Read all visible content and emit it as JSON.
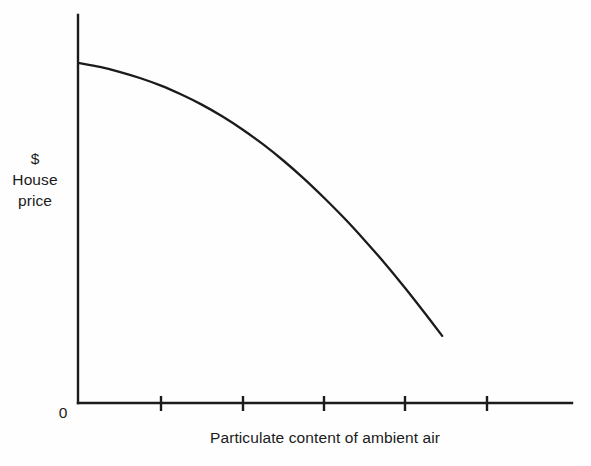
{
  "chart_data": {
    "type": "line",
    "title": "",
    "subtitle": "",
    "xlabel": "Particulate content of ambient air",
    "ylabel_lines": [
      "$",
      "House",
      "price"
    ],
    "ylabel": "$ House price",
    "origin_label": "0",
    "grid": false,
    "legend": null,
    "legend_position": "none",
    "axis_color": "#1b1b1b",
    "curve_color": "#1b1b1b",
    "background_color": "#fefefe",
    "xlim": [
      0,
      6.1
    ],
    "ylim": [
      0,
      1.0
    ],
    "x_tick_labels": [
      "",
      "",
      "",
      "",
      ""
    ],
    "x_tick_positions": [
      1,
      2,
      3,
      4,
      5
    ],
    "y_tick_labels": [],
    "annotations": [],
    "series": [
      {
        "name": "House price vs particulate content",
        "x": [
          0.0,
          0.25,
          0.5,
          0.75,
          1.0,
          1.25,
          1.5,
          1.75,
          2.0,
          2.25,
          2.5,
          2.75,
          3.0,
          3.25,
          3.5,
          3.75,
          4.0,
          4.25,
          4.45
        ],
        "y": [
          0.876,
          0.866,
          0.853,
          0.837,
          0.818,
          0.795,
          0.769,
          0.739,
          0.705,
          0.667,
          0.625,
          0.579,
          0.529,
          0.476,
          0.419,
          0.359,
          0.295,
          0.228,
          0.173
        ]
      }
    ],
    "points_pixels": [
      [
        78,
        62
      ],
      [
        161,
        100
      ],
      [
        243,
        165
      ],
      [
        324,
        250
      ],
      [
        405,
        330
      ],
      [
        441,
        372
      ]
    ],
    "shape_description": "Monotonically decreasing, concave-down curve"
  },
  "geometry": {
    "y_axis_x": 78,
    "y_axis_top": 15,
    "x_axis_y": 403,
    "x_axis_right": 572,
    "tick_pixels": [
      161,
      243,
      324,
      405,
      487
    ],
    "tick_height": 13
  }
}
